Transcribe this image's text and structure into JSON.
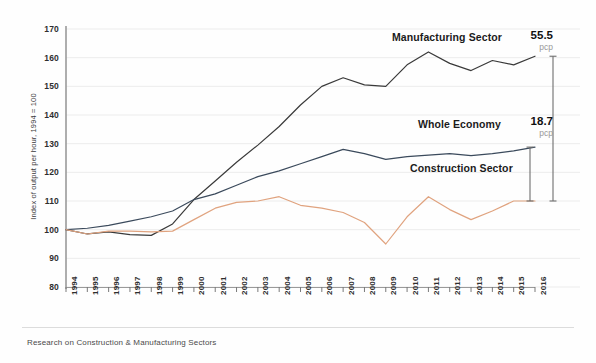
{
  "footer": {
    "caption": "Research on Construction & Manufacturing Sectors"
  },
  "annotations": [
    {
      "name": "manufacturing-change",
      "value": "55.5",
      "unit": "pcp"
    },
    {
      "name": "whole-economy-change",
      "value": "18.7",
      "unit": "pcp"
    }
  ],
  "chart_data": {
    "type": "line",
    "title": "",
    "xlabel": "",
    "ylabel": "Index of output per hour, 1994 = 100",
    "ylim": [
      80,
      170
    ],
    "yticks": [
      80,
      90,
      100,
      110,
      120,
      130,
      140,
      150,
      160,
      170
    ],
    "grid": true,
    "legend_position": "inline-labels",
    "categories": [
      "1994",
      "1995",
      "1996",
      "1997",
      "1998",
      "1999",
      "2000",
      "2001",
      "2002",
      "2003",
      "2004",
      "2005",
      "2006",
      "2007",
      "2008",
      "2009",
      "2010",
      "2011",
      "2012",
      "2013",
      "2014",
      "2015",
      "2016"
    ],
    "series": [
      {
        "name": "Manufacturing Sector",
        "color": "#3a3a3a",
        "values": [
          100.0,
          98.5,
          99.2,
          98.3,
          98.0,
          102.0,
          110.5,
          117.0,
          123.5,
          129.5,
          136.0,
          143.5,
          150.0,
          153.0,
          150.5,
          150.0,
          157.5,
          162.0,
          158.0,
          155.5,
          159.0,
          157.5,
          160.5
        ]
      },
      {
        "name": "Whole Economy",
        "color": "#3b4a5c",
        "values": [
          100.0,
          100.5,
          101.5,
          103.0,
          104.5,
          106.5,
          110.5,
          112.5,
          115.5,
          118.5,
          120.5,
          123.0,
          125.5,
          128.0,
          126.5,
          124.5,
          125.5,
          126.0,
          126.5,
          125.8,
          126.5,
          127.5,
          128.8
        ]
      },
      {
        "name": "Construction Sector",
        "color": "#e0a37f",
        "values": [
          100.0,
          98.5,
          99.5,
          99.5,
          99.2,
          99.5,
          103.5,
          107.5,
          109.5,
          110.0,
          111.5,
          108.5,
          107.5,
          106.0,
          102.5,
          95.0,
          104.5,
          111.5,
          107.0,
          103.5,
          106.5,
          110.0,
          110.0
        ]
      }
    ]
  }
}
